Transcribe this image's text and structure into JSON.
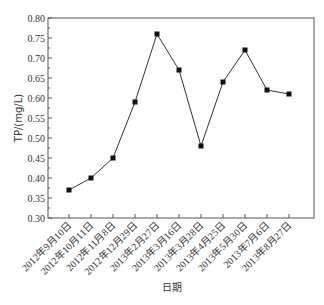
{
  "chart_data": {
    "type": "line",
    "title": "",
    "xlabel": "日期",
    "ylabel": "TP/(mg/L)",
    "ylim": [
      0.3,
      0.8
    ],
    "yticks": [
      "0.30",
      "0.35",
      "0.40",
      "0.45",
      "0.50",
      "0.55",
      "0.60",
      "0.65",
      "0.70",
      "0.75",
      "0.80"
    ],
    "grid": false,
    "legend": null,
    "marker": "square",
    "categories": [
      "2012年9月10日",
      "2012年10月11日",
      "2012年11月8日",
      "2012年12月29日",
      "2013年2月27日",
      "2013年3月16日",
      "2013年3月28日",
      "2013年4月25日",
      "2013年5月30日",
      "2013年7月6日",
      "2013年8月27日"
    ],
    "values": [
      0.37,
      0.4,
      0.45,
      0.59,
      0.76,
      0.67,
      0.48,
      0.64,
      0.72,
      0.62,
      0.61
    ]
  },
  "colors": {
    "line": "#333333",
    "marker": "#111111",
    "axis": "#555555"
  }
}
